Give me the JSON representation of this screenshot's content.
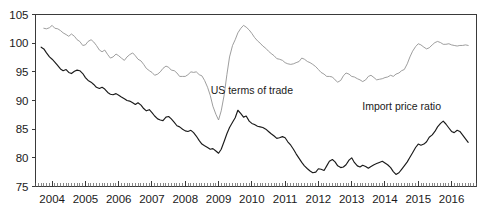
{
  "chart_data": {
    "type": "line",
    "title": "",
    "subtitle": "",
    "xlabel": "",
    "ylabel": "",
    "xlim": [
      2003.5,
      2016.75
    ],
    "ylim": [
      75,
      105
    ],
    "yticks": [
      75,
      80,
      85,
      90,
      95,
      100,
      105
    ],
    "ytick_labels": [
      "75",
      "80",
      "85",
      "90",
      "95",
      "100",
      "105"
    ],
    "xticks": [
      2004,
      2005,
      2006,
      2007,
      2008,
      2009,
      2010,
      2011,
      2012,
      2013,
      2014,
      2015,
      2016
    ],
    "xtick_labels": [
      "2004",
      "2005",
      "2006",
      "2007",
      "2008",
      "2009",
      "2010",
      "2011",
      "2012",
      "2013",
      "2014",
      "2015",
      "2016"
    ],
    "minor_tick_interval_years": 0.0833,
    "grid": false,
    "legend_position": "inline-annotations",
    "annotations": [
      {
        "text": "US terms of trade",
        "x": 2010.0,
        "y": 91.2,
        "series": "US terms of trade"
      },
      {
        "text": "Import price ratio",
        "x": 2014.5,
        "y": 88.3,
        "series": "Import price ratio"
      }
    ],
    "series": [
      {
        "name": "US terms of trade",
        "color": "#8c8c8c",
        "x": [
          2003.75,
          2003.83,
          2003.92,
          2004.0,
          2004.08,
          2004.17,
          2004.25,
          2004.33,
          2004.42,
          2004.5,
          2004.58,
          2004.67,
          2004.75,
          2004.83,
          2004.92,
          2005.0,
          2005.08,
          2005.17,
          2005.25,
          2005.33,
          2005.42,
          2005.5,
          2005.58,
          2005.67,
          2005.75,
          2005.83,
          2005.92,
          2006.0,
          2006.08,
          2006.17,
          2006.25,
          2006.33,
          2006.42,
          2006.5,
          2006.58,
          2006.67,
          2006.75,
          2006.83,
          2006.92,
          2007.0,
          2007.08,
          2007.17,
          2007.25,
          2007.33,
          2007.42,
          2007.5,
          2007.58,
          2007.67,
          2007.75,
          2007.83,
          2007.92,
          2008.0,
          2008.08,
          2008.17,
          2008.25,
          2008.33,
          2008.42,
          2008.5,
          2008.58,
          2008.67,
          2008.75,
          2008.83,
          2008.92,
          2009.0,
          2009.08,
          2009.17,
          2009.25,
          2009.33,
          2009.42,
          2009.5,
          2009.58,
          2009.67,
          2009.75,
          2009.83,
          2009.92,
          2010.0,
          2010.08,
          2010.17,
          2010.25,
          2010.33,
          2010.42,
          2010.5,
          2010.58,
          2010.67,
          2010.75,
          2010.83,
          2010.92,
          2011.0,
          2011.08,
          2011.17,
          2011.25,
          2011.33,
          2011.42,
          2011.5,
          2011.58,
          2011.67,
          2011.75,
          2011.83,
          2011.92,
          2012.0,
          2012.08,
          2012.17,
          2012.25,
          2012.33,
          2012.42,
          2012.5,
          2012.58,
          2012.67,
          2012.75,
          2012.83,
          2012.92,
          2013.0,
          2013.08,
          2013.17,
          2013.25,
          2013.33,
          2013.42,
          2013.5,
          2013.58,
          2013.67,
          2013.75,
          2013.83,
          2013.92,
          2014.0,
          2014.08,
          2014.17,
          2014.25,
          2014.33,
          2014.42,
          2014.5,
          2014.58,
          2014.67,
          2014.75,
          2014.83,
          2014.92,
          2015.0,
          2015.08,
          2015.17,
          2015.25,
          2015.33,
          2015.42,
          2015.5,
          2015.58,
          2015.67,
          2015.75,
          2015.83,
          2015.92,
          2016.0,
          2016.08,
          2016.17,
          2016.25,
          2016.33,
          2016.42,
          2016.5
        ],
        "y": [
          102.6,
          102.5,
          102.7,
          103.1,
          102.6,
          102.5,
          102.2,
          101.8,
          101.5,
          101.2,
          101.6,
          101.2,
          100.6,
          100.3,
          99.6,
          99.7,
          100.3,
          100.6,
          100.2,
          99.6,
          98.8,
          98.5,
          98.8,
          98.0,
          97.4,
          97.6,
          98.1,
          97.8,
          97.4,
          97.0,
          97.6,
          98.0,
          98.3,
          97.8,
          97.2,
          96.9,
          96.3,
          95.6,
          95.2,
          94.9,
          94.4,
          94.6,
          95.0,
          95.6,
          96.0,
          95.8,
          95.3,
          95.2,
          94.8,
          94.2,
          94.2,
          94.2,
          94.5,
          95.0,
          94.9,
          95.0,
          94.5,
          94.3,
          93.5,
          92.3,
          90.9,
          89.0,
          87.6,
          86.6,
          88.2,
          91.0,
          94.5,
          97.6,
          99.6,
          100.6,
          101.8,
          102.6,
          103.1,
          102.8,
          102.3,
          101.7,
          101.0,
          100.4,
          100.0,
          99.5,
          99.1,
          98.6,
          98.2,
          97.8,
          97.3,
          97.2,
          97.0,
          96.6,
          96.4,
          96.3,
          96.4,
          96.6,
          96.8,
          97.4,
          97.2,
          96.8,
          96.6,
          96.3,
          95.9,
          95.4,
          94.9,
          94.6,
          94.2,
          94.2,
          94.1,
          93.6,
          93.2,
          93.5,
          94.3,
          94.8,
          94.6,
          94.2,
          94.1,
          93.8,
          93.6,
          93.3,
          93.6,
          94.2,
          94.4,
          94.0,
          93.6,
          93.7,
          93.8,
          94.0,
          94.1,
          94.4,
          94.2,
          94.6,
          94.8,
          95.2,
          95.4,
          96.4,
          97.6,
          98.6,
          99.4,
          99.9,
          99.7,
          99.3,
          99.0,
          99.2,
          99.7,
          100.1,
          100.3,
          100.1,
          99.8,
          99.8,
          99.9,
          99.7,
          99.6,
          99.5,
          99.6,
          99.6,
          99.7,
          99.6
        ]
      },
      {
        "name": "Import price ratio",
        "color": "#1a1a1a",
        "x": [
          2003.67,
          2003.75,
          2003.83,
          2003.92,
          2004.0,
          2004.08,
          2004.17,
          2004.25,
          2004.33,
          2004.42,
          2004.5,
          2004.58,
          2004.67,
          2004.75,
          2004.83,
          2004.92,
          2005.0,
          2005.08,
          2005.17,
          2005.25,
          2005.33,
          2005.42,
          2005.5,
          2005.58,
          2005.67,
          2005.75,
          2005.83,
          2005.92,
          2006.0,
          2006.08,
          2006.17,
          2006.25,
          2006.33,
          2006.42,
          2006.5,
          2006.58,
          2006.67,
          2006.75,
          2006.83,
          2006.92,
          2007.0,
          2007.08,
          2007.17,
          2007.25,
          2007.33,
          2007.42,
          2007.5,
          2007.58,
          2007.67,
          2007.75,
          2007.83,
          2007.92,
          2008.0,
          2008.08,
          2008.17,
          2008.25,
          2008.33,
          2008.42,
          2008.5,
          2008.58,
          2008.67,
          2008.75,
          2008.83,
          2008.92,
          2009.0,
          2009.08,
          2009.17,
          2009.25,
          2009.33,
          2009.42,
          2009.5,
          2009.58,
          2009.67,
          2009.75,
          2009.83,
          2009.92,
          2010.0,
          2010.08,
          2010.17,
          2010.25,
          2010.33,
          2010.42,
          2010.5,
          2010.58,
          2010.67,
          2010.75,
          2010.83,
          2010.92,
          2011.0,
          2011.08,
          2011.17,
          2011.25,
          2011.33,
          2011.42,
          2011.5,
          2011.58,
          2011.67,
          2011.75,
          2011.83,
          2011.92,
          2012.0,
          2012.08,
          2012.17,
          2012.25,
          2012.33,
          2012.42,
          2012.5,
          2012.58,
          2012.67,
          2012.75,
          2012.83,
          2012.92,
          2013.0,
          2013.08,
          2013.17,
          2013.25,
          2013.33,
          2013.42,
          2013.5,
          2013.58,
          2013.67,
          2013.75,
          2013.83,
          2013.92,
          2014.0,
          2014.08,
          2014.17,
          2014.25,
          2014.33,
          2014.42,
          2014.5,
          2014.58,
          2014.67,
          2014.75,
          2014.83,
          2014.92,
          2015.0,
          2015.08,
          2015.17,
          2015.25,
          2015.33,
          2015.42,
          2015.5,
          2015.58,
          2015.67,
          2015.75,
          2015.83,
          2015.92,
          2016.0,
          2016.08,
          2016.17,
          2016.25,
          2016.33,
          2016.42,
          2016.5
        ],
        "y": [
          99.3,
          99.0,
          98.3,
          97.6,
          97.2,
          96.7,
          96.1,
          95.5,
          95.2,
          95.4,
          94.9,
          94.7,
          95.1,
          95.3,
          95.2,
          94.7,
          94.0,
          93.5,
          93.2,
          92.8,
          92.3,
          92.1,
          92.3,
          92.0,
          91.4,
          91.1,
          91.0,
          91.2,
          90.9,
          90.6,
          90.3,
          90.0,
          89.9,
          89.6,
          89.3,
          89.6,
          89.2,
          88.6,
          88.2,
          88.4,
          87.9,
          87.3,
          86.8,
          86.6,
          86.5,
          87.1,
          87.2,
          86.8,
          86.2,
          85.6,
          85.4,
          85.0,
          84.7,
          84.6,
          84.8,
          84.4,
          83.8,
          83.0,
          82.4,
          82.1,
          81.8,
          81.5,
          81.6,
          81.2,
          80.8,
          81.5,
          82.9,
          84.2,
          85.3,
          86.2,
          87.0,
          88.3,
          87.7,
          87.1,
          87.3,
          86.4,
          86.0,
          85.8,
          85.5,
          85.4,
          85.3,
          85.0,
          84.6,
          84.2,
          83.8,
          83.4,
          83.5,
          83.7,
          83.5,
          82.8,
          82.2,
          81.5,
          80.7,
          79.9,
          79.2,
          78.6,
          78.1,
          77.7,
          77.4,
          77.5,
          78.1,
          78.0,
          77.8,
          78.6,
          79.4,
          79.7,
          79.3,
          78.6,
          78.3,
          78.4,
          78.8,
          79.6,
          80.0,
          79.2,
          78.6,
          78.4,
          78.7,
          78.5,
          78.2,
          78.5,
          78.8,
          79.0,
          79.2,
          79.4,
          79.1,
          78.8,
          78.3,
          77.6,
          77.1,
          77.4,
          78.0,
          78.6,
          79.3,
          80.1,
          80.9,
          81.8,
          82.4,
          82.2,
          82.4,
          82.8,
          83.6,
          84.0,
          84.6,
          85.4,
          86.0,
          86.4,
          85.9,
          85.2,
          84.6,
          84.4,
          84.8,
          84.6,
          84.0,
          83.3,
          82.7
        ]
      }
    ]
  }
}
